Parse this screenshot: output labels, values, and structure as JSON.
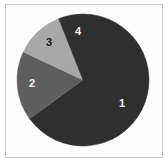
{
  "figure": {
    "title": "",
    "frame_color": "#c9c9c9",
    "background_color": "#fdfdfd"
  },
  "chart_data": {
    "type": "pie",
    "title": "",
    "xlabel": "",
    "ylabel": "",
    "legend": "none",
    "labels": [
      "1",
      "2",
      "3",
      "4"
    ],
    "values": [
      65,
      17,
      12,
      6
    ],
    "units": "percent",
    "start_angle_deg": 0,
    "direction": "clockwise",
    "center": {
      "x": 83,
      "y": 80
    },
    "radius": 66,
    "slices": [
      {
        "label": "1",
        "value": 65,
        "color": "#2f2f2f",
        "label_color": "#f2f2f2",
        "label_x": 122,
        "label_y": 103,
        "start_deg": 0,
        "end_deg": 234
      },
      {
        "label": "2",
        "value": 17,
        "color": "#5e5e5e",
        "label_color": "#f2f2f2",
        "label_x": 32,
        "label_y": 83,
        "start_deg": 234,
        "end_deg": 295.2
      },
      {
        "label": "3",
        "value": 12,
        "color": "#a8a8a8",
        "label_color": "#1c1c1c",
        "label_x": 49,
        "label_y": 42,
        "start_deg": 295.2,
        "end_deg": 338.4
      },
      {
        "label": "4",
        "value": 6,
        "color": "#2f2f2f",
        "label_color": "#f2f2f2",
        "label_x": 78,
        "label_y": 31,
        "start_deg": 338.4,
        "end_deg": 360
      }
    ]
  }
}
